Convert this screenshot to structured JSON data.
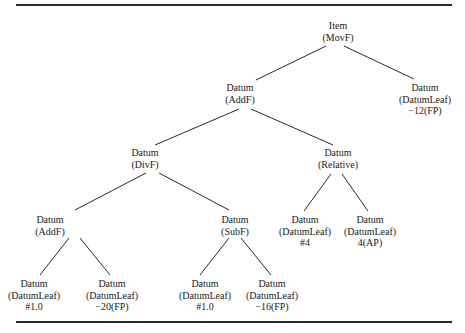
{
  "diagram": {
    "type": "tree",
    "nodes": [
      {
        "id": "n0",
        "lines": [
          "Item",
          "(MovF)"
        ],
        "x": 338,
        "y": 20
      },
      {
        "id": "n1",
        "lines": [
          "Datum",
          "(AddF)"
        ],
        "x": 240,
        "y": 82
      },
      {
        "id": "n2",
        "lines": [
          "Datum",
          "(DatumLeaf)",
          "−12(FP)"
        ],
        "x": 425,
        "y": 82
      },
      {
        "id": "n3",
        "lines": [
          "Datum",
          "(DivF)"
        ],
        "x": 145,
        "y": 147
      },
      {
        "id": "n4",
        "lines": [
          "Datum",
          "(Relative)"
        ],
        "x": 338,
        "y": 147
      },
      {
        "id": "n5",
        "lines": [
          "Datum",
          "(AddF)"
        ],
        "x": 50,
        "y": 214
      },
      {
        "id": "n6",
        "lines": [
          "Datum",
          "(SubF)"
        ],
        "x": 235,
        "y": 214
      },
      {
        "id": "n7",
        "lines": [
          "Datum",
          "(DatumLeaf)",
          "#4"
        ],
        "x": 305,
        "y": 214
      },
      {
        "id": "n8",
        "lines": [
          "Datum",
          "(DatumLeaf)",
          "4(AP)"
        ],
        "x": 370,
        "y": 214
      },
      {
        "id": "n9",
        "lines": [
          "Datum",
          "(DatumLeaf)",
          "#1.0"
        ],
        "x": 17,
        "y": 278
      },
      {
        "id": "n10",
        "lines": [
          "Datum",
          "(DatumLeaf)",
          "−20(FP)"
        ],
        "x": 112,
        "y": 278
      },
      {
        "id": "n11",
        "lines": [
          "Datum",
          "(DatumLeaf)",
          "#1.0"
        ],
        "x": 205,
        "y": 278
      },
      {
        "id": "n12",
        "lines": [
          "Datum",
          "(DatumLeaf)",
          "−16(FP)"
        ],
        "x": 272,
        "y": 278
      }
    ],
    "edges": [
      {
        "from": "n0",
        "to": "n1",
        "x1": 326,
        "y1": 46,
        "x2": 256,
        "y2": 80
      },
      {
        "from": "n0",
        "to": "n2",
        "x1": 344,
        "y1": 46,
        "x2": 414,
        "y2": 79
      },
      {
        "from": "n1",
        "to": "n3",
        "x1": 239,
        "y1": 109,
        "x2": 155,
        "y2": 145
      },
      {
        "from": "n1",
        "to": "n4",
        "x1": 251,
        "y1": 109,
        "x2": 333,
        "y2": 145
      },
      {
        "from": "n3",
        "to": "n5",
        "x1": 146,
        "y1": 173,
        "x2": 75,
        "y2": 210
      },
      {
        "from": "n3",
        "to": "n6",
        "x1": 159,
        "y1": 173,
        "x2": 229,
        "y2": 210
      },
      {
        "from": "n4",
        "to": "n7",
        "x1": 331,
        "y1": 174,
        "x2": 304,
        "y2": 211
      },
      {
        "from": "n4",
        "to": "n8",
        "x1": 342,
        "y1": 174,
        "x2": 368,
        "y2": 211
      },
      {
        "from": "n5",
        "to": "n9",
        "x1": 69,
        "y1": 238,
        "x2": 40,
        "y2": 275
      },
      {
        "from": "n5",
        "to": "n10",
        "x1": 80,
        "y1": 238,
        "x2": 110,
        "y2": 275
      },
      {
        "from": "n6",
        "to": "n11",
        "x1": 229,
        "y1": 238,
        "x2": 200,
        "y2": 275
      },
      {
        "from": "n6",
        "to": "n12",
        "x1": 241,
        "y1": 238,
        "x2": 271,
        "y2": 275
      }
    ]
  }
}
